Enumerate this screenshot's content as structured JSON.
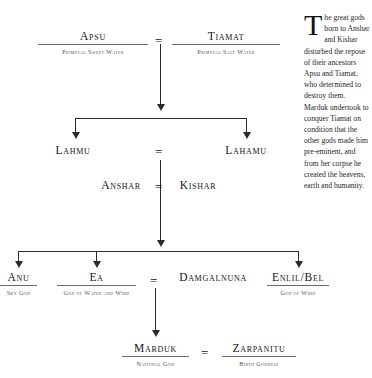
{
  "diagram": {
    "generations": [
      {
        "id": "gen1",
        "nodes": [
          {
            "name": "Apsu",
            "subtitle": "Primeval Sweet Water"
          },
          {
            "name": "Tiamat",
            "subtitle": "Primeval Salt Water"
          }
        ],
        "union_symbol": "="
      },
      {
        "id": "gen2",
        "nodes": [
          {
            "name": "Lahmu",
            "subtitle": ""
          },
          {
            "name": "Lahamu",
            "subtitle": ""
          }
        ],
        "union_symbol": "="
      },
      {
        "id": "gen3",
        "nodes": [
          {
            "name": "Anshar",
            "subtitle": ""
          },
          {
            "name": "Kishar",
            "subtitle": ""
          }
        ],
        "union_symbol": "="
      },
      {
        "id": "gen4",
        "nodes": [
          {
            "name": "Anu",
            "subtitle": "Sky God"
          },
          {
            "name": "Ea",
            "subtitle": "God of Water and Wind"
          },
          {
            "name": "Damgalnuna",
            "subtitle": ""
          },
          {
            "name": "Enlil/Bel",
            "subtitle": "God of Wind"
          }
        ],
        "union_symbol": "="
      },
      {
        "id": "gen5",
        "nodes": [
          {
            "name": "Marduk",
            "subtitle": "National God"
          },
          {
            "name": "Zarpanitu",
            "subtitle": "Birth Goddess"
          }
        ],
        "union_symbol": "="
      }
    ]
  },
  "sidebar_text": {
    "dropcap": "T",
    "body": "he great gods born to Anshar and Kishar disturbed the repose of their ancestors Apsu and Tiamat, who determined to destroy them. Marduk undertook to conquer Tiamat on condition that the other gods made him pre-eminent, and from her corpse he created the heavens, earth and humanity."
  },
  "colors": {
    "background": "#ffffff",
    "text": "#141414",
    "subtitle": "#555555",
    "line": "#2b2b2b",
    "rule": "#6a6a6a"
  }
}
